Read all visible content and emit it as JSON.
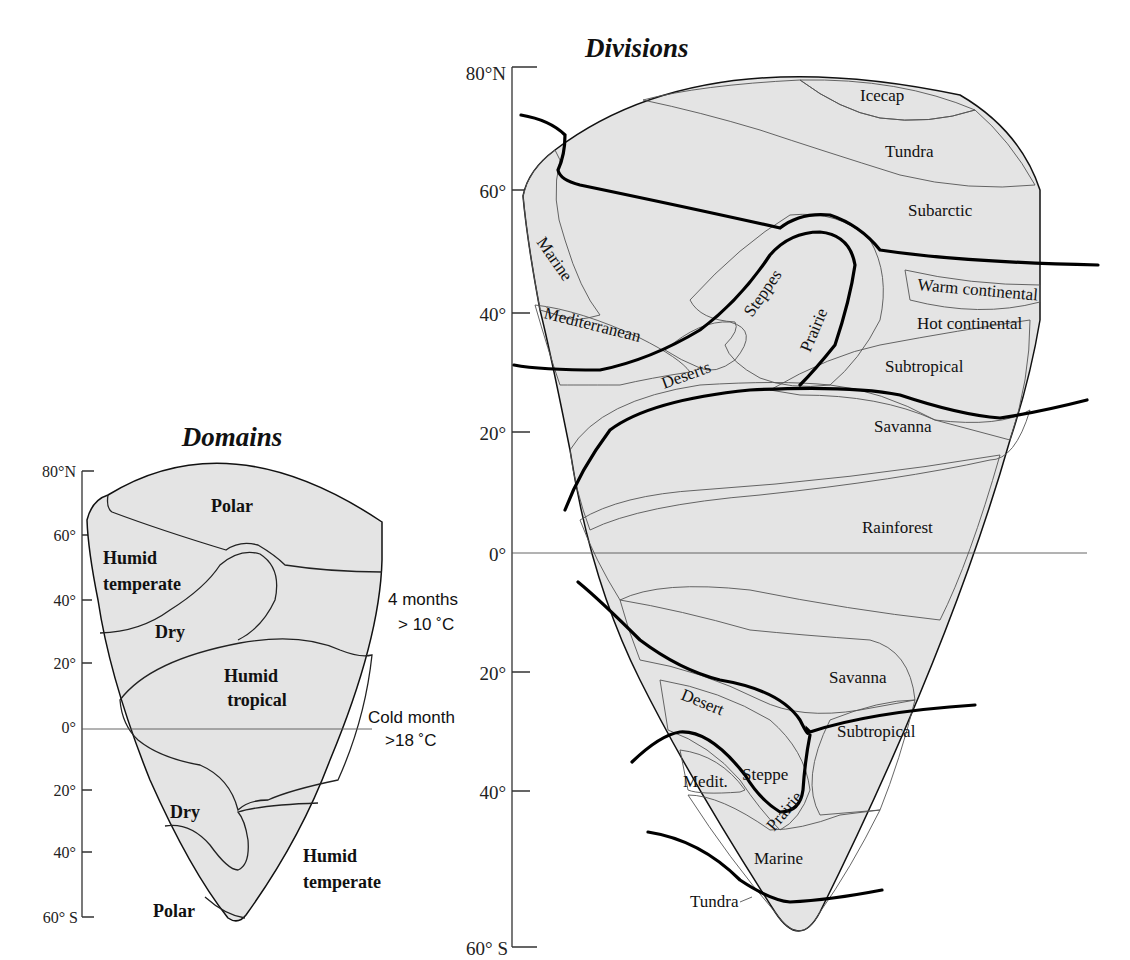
{
  "colors": {
    "light": "#e4e4e4",
    "medium": "#cdcdcd",
    "dark": "#b6b6b6",
    "white": "#ffffff"
  },
  "domains": {
    "title": "Domains",
    "axis_ticks": [
      "80°N",
      "60°",
      "40°",
      "20°",
      "0°",
      "20°",
      "40°",
      "60° S"
    ],
    "labels": {
      "polar_north": "Polar",
      "humid_temperate_north_1": "Humid",
      "humid_temperate_north_2": "temperate",
      "dry_north": "Dry",
      "humid_tropical_1": "Humid",
      "humid_tropical_2": "tropical",
      "dry_south": "Dry",
      "humid_temperate_south_1": "Humid",
      "humid_temperate_south_2": "temperate",
      "polar_south": "Polar"
    },
    "notes": {
      "four_months_1": "4 months",
      "four_months_2": "> 10 ˚C",
      "cold_month_1": "Cold month",
      "cold_month_2": ">18 ˚C"
    }
  },
  "divisions": {
    "title": "Divisions",
    "axis_ticks": [
      "80°N",
      "60°",
      "40°",
      "20°",
      "0°",
      "20°",
      "40°",
      "60° S"
    ],
    "labels": {
      "icecap": "Icecap",
      "tundra_north": "Tundra",
      "subarctic": "Subarctic",
      "marine_north": "Marine",
      "warm_continental": "Warm continental",
      "hot_continental": "Hot continental",
      "steppes": "Steppes",
      "prairie_north": "Prairie",
      "mediterranean": "Mediterranean",
      "deserts": "Deserts",
      "subtropical_north": "Subtropical",
      "savanna_north": "Savanna",
      "rainforest": "Rainforest",
      "savanna_south": "Savanna",
      "desert_south": "Desert",
      "subtropical_south": "Subtropical",
      "medit_south": "Medit.",
      "steppe_south": "Steppe",
      "prairie_south": "Prairie",
      "marine_south": "Marine",
      "tundra_south": "Tundra"
    }
  }
}
